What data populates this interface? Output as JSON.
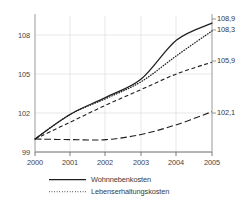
{
  "chart_data": {
    "type": "line",
    "title": "",
    "subtitle": "",
    "xlabel": "",
    "ylabel": "",
    "x": [
      2000,
      2001,
      2002,
      2003,
      2004,
      2005
    ],
    "xtick_labels": [
      "2000",
      "2001",
      "2002",
      "2003",
      "2004",
      "2005"
    ],
    "ytick_labels": [
      "99",
      "102",
      "105",
      "108"
    ],
    "yticks": [
      99,
      102,
      105,
      108
    ],
    "xlim": [
      2000,
      2005
    ],
    "ylim": [
      99,
      109.6
    ],
    "grid": true,
    "legend_position": "below-left",
    "series": [
      {
        "name": "Wohnnebenkosten",
        "style": "solid",
        "color": "#1f1f1f",
        "values": [
          100.0,
          101.9,
          103.2,
          104.6,
          107.6,
          108.9
        ],
        "end_label": "108,9"
      },
      {
        "name": "Lebenserhaltungskosten",
        "style": "dotted",
        "color": "#1f1f1f",
        "values": [
          100.0,
          101.9,
          103.1,
          104.4,
          106.4,
          108.3
        ],
        "end_label": "108,3"
      },
      {
        "name": "",
        "style": "dashed",
        "color": "#1f1f1f",
        "values": [
          100.0,
          101.3,
          102.6,
          103.8,
          105.0,
          105.9
        ],
        "end_label": "105,9"
      },
      {
        "name": "",
        "style": "long-dashed",
        "color": "#1f1f1f",
        "values": [
          100.0,
          99.95,
          99.95,
          100.35,
          101.1,
          102.1
        ],
        "end_label": "102,1"
      }
    ],
    "end_labels": [
      "108,9",
      "108,3",
      "105,9",
      "102,1"
    ]
  },
  "legend": {
    "items": [
      {
        "label": "Wohnnebenkosten",
        "style": "solid"
      },
      {
        "label": "Lebenserhaltungskosten",
        "style": "dotted"
      }
    ]
  }
}
